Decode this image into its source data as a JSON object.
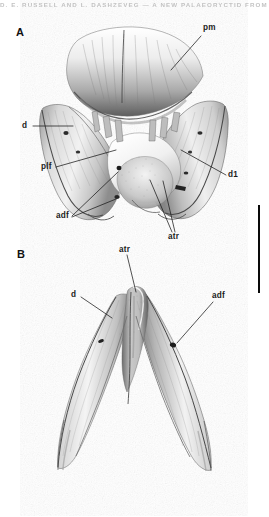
{
  "figure": {
    "running_head": "D. E. RUSSELL AND L. DASHZEVEG — A NEW PALAEORYCTID FROM MONGOLIA",
    "background_color": "#ffffff",
    "ink_color": "#1a1a1a",
    "width_px": 269,
    "height_px": 517
  },
  "panels": [
    {
      "id": "A",
      "letter": "A",
      "description": "Anterior portion of lower jaw in occlusal / dorsal view",
      "labels": [
        {
          "key": "pm",
          "text": "pm",
          "x": 203,
          "y": 29,
          "meaning": "posterior mental region"
        },
        {
          "key": "d",
          "text": "d",
          "x": 22,
          "y": 127,
          "meaning": "dentary"
        },
        {
          "key": "plf",
          "text": "plf",
          "x": 41,
          "y": 168,
          "meaning": "posterolateral foramen"
        },
        {
          "key": "adf",
          "text": "adf",
          "x": 56,
          "y": 214,
          "meaning": "anterior dental foramina"
        },
        {
          "key": "d1",
          "text": "d1",
          "x": 228,
          "y": 176,
          "meaning": "first lower incisor alveolus"
        },
        {
          "key": "atr",
          "text": "atr",
          "x": 168,
          "y": 236,
          "meaning": "anterior trough"
        }
      ]
    },
    {
      "id": "B",
      "letter": "B",
      "description": "Anterior portion of lower jaw in lateral / ventral view",
      "labels": [
        {
          "key": "atr",
          "text": "atr",
          "x": 120,
          "y": 248,
          "meaning": "anterior trough"
        },
        {
          "key": "d",
          "text": "d",
          "x": 71,
          "y": 295,
          "meaning": "dentary"
        },
        {
          "key": "adf",
          "text": "adf",
          "x": 212,
          "y": 295,
          "meaning": "anterior dental foramen"
        }
      ]
    }
  ],
  "scale_bar": {
    "name": "scale-bar",
    "orientation": "vertical",
    "x": 258,
    "y_top": 205,
    "height": 88,
    "color": "#0a0a0a"
  }
}
